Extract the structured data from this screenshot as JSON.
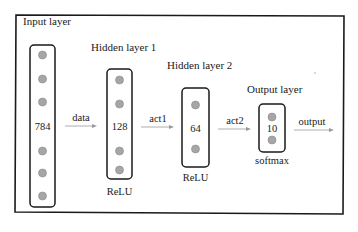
{
  "diagram": {
    "frame_title": "Input layer",
    "layers": [
      {
        "id": "input",
        "title": "Input layer",
        "units": "784",
        "activation": "",
        "nodes": 6
      },
      {
        "id": "hidden1",
        "title": "Hidden layer 1",
        "units": "128",
        "activation": "ReLU",
        "nodes": 4
      },
      {
        "id": "hidden2",
        "title": "Hidden layer 2",
        "units": "64",
        "activation": "ReLU",
        "nodes": 2
      },
      {
        "id": "output",
        "title": "Output layer",
        "units": "10",
        "activation": "softmax",
        "nodes": 2
      }
    ],
    "edges": [
      {
        "from": "input",
        "to": "hidden1",
        "label": "data"
      },
      {
        "from": "hidden1",
        "to": "hidden2",
        "label": "act1"
      },
      {
        "from": "hidden2",
        "to": "output",
        "label": "act2"
      },
      {
        "from": "output",
        "to": "",
        "label": "output"
      }
    ],
    "colors": {
      "frame": "#1a1a1a",
      "layer_box": "#1a1a1a",
      "node_fill": "#a6a6a6",
      "node_stroke": "#8a8a8a",
      "arrow": "#9a9a9a",
      "text": "#1a1a1a"
    }
  }
}
